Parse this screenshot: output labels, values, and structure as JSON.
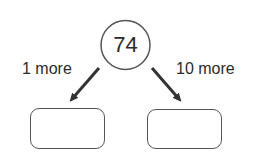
{
  "diagram": {
    "center": {
      "value": "74"
    },
    "left": {
      "label": "1 more",
      "answer": ""
    },
    "right": {
      "label": "10 more",
      "answer": ""
    }
  },
  "colors": {
    "stroke": "#555555",
    "arrow": "#333333",
    "text": "#2b2b2b"
  }
}
